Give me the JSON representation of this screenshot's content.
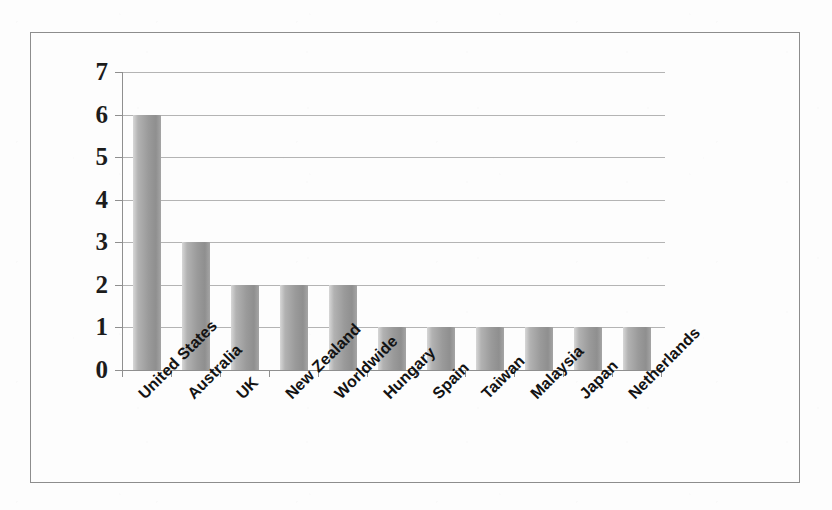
{
  "chart_data": {
    "type": "bar",
    "title": "",
    "subtitle": "",
    "xlabel": "",
    "ylabel": "",
    "categories": [
      "United States",
      "Australia",
      "UK",
      "New Zealand",
      "Worldwide",
      "Hungary",
      "Spain",
      "Taiwan",
      "Malaysia",
      "Japan",
      "Netherlands"
    ],
    "values": [
      6,
      3,
      2,
      2,
      2,
      1,
      1,
      1,
      1,
      1,
      1
    ],
    "ylim": [
      0,
      7
    ],
    "ytick_labels": [
      "7",
      "6",
      "5",
      "4",
      "3",
      "2",
      "1",
      "0"
    ],
    "ytick_values": [
      7,
      6,
      5,
      4,
      3,
      2,
      1,
      0
    ],
    "grid": "horizontal",
    "legend": "none",
    "annotations": [],
    "colors": {
      "bar_light": "#d7d7d7",
      "bar_mid": "#9a9a9a",
      "bar_dark": "#8f8f8f",
      "gridline": "#b4b4b4",
      "axis": "#8f8f8f",
      "text": "#1c1c1c",
      "frame_border": "#8d8d8d",
      "background": "#fdfdfd"
    }
  }
}
